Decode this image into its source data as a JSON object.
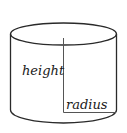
{
  "diagram": {
    "type": "cylinder",
    "labels": {
      "height": "height",
      "radius": "radius"
    },
    "colors": {
      "stroke": "#2a2a2a",
      "inner_line": "#555555",
      "text": "#1a1a1a",
      "background": "#ffffff"
    }
  }
}
